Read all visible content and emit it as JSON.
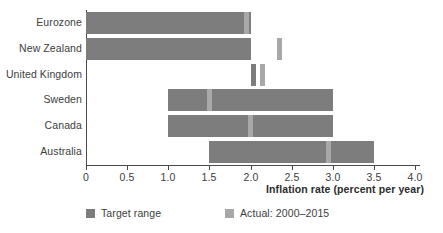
{
  "chart_data": {
    "type": "bar",
    "orientation": "horizontal",
    "title": "",
    "xlabel": "Inflation rate (percent per year)",
    "ylabel": "",
    "xlim": [
      0,
      4.0
    ],
    "xticks": [
      0,
      0.5,
      1.0,
      1.5,
      2.0,
      2.5,
      3.0,
      3.5,
      4.0
    ],
    "xtick_labels": [
      "0",
      "0.5",
      "1.0",
      "1.5",
      "2.0",
      "2.5",
      "3.0",
      "3.5",
      "4.0"
    ],
    "grid": false,
    "categories": [
      "Eurozone",
      "New Zealand",
      "United Kingdom",
      "Sweden",
      "Canada",
      "Australia"
    ],
    "legend": {
      "position": "bottom",
      "entries": [
        {
          "name": "Target range",
          "color": "#7d7d7d"
        },
        {
          "name": "Actual: 2000–2015",
          "color": "#a8a8a8"
        }
      ]
    },
    "series": [
      {
        "name": "Target range",
        "type": "range",
        "color": "#7d7d7d",
        "values": [
          {
            "category": "Eurozone",
            "low": 0.0,
            "high": 2.0
          },
          {
            "category": "New Zealand",
            "low": 0.0,
            "high": 2.0
          },
          {
            "category": "United Kingdom",
            "low": 2.0,
            "high": 2.05
          },
          {
            "category": "Sweden",
            "low": 1.0,
            "high": 3.0
          },
          {
            "category": "Canada",
            "low": 1.0,
            "high": 3.0
          },
          {
            "category": "Australia",
            "low": 1.5,
            "high": 3.5
          }
        ]
      },
      {
        "name": "Actual: 2000–2015",
        "type": "marker",
        "color": "#a8a8a8",
        "values": [
          {
            "category": "Eurozone",
            "value": 1.95
          },
          {
            "category": "New Zealand",
            "value": 2.35
          },
          {
            "category": "United Kingdom",
            "value": 2.15
          },
          {
            "category": "Sweden",
            "value": 1.5
          },
          {
            "category": "Canada",
            "value": 2.0
          },
          {
            "category": "Australia",
            "value": 2.95
          }
        ]
      }
    ]
  },
  "axis_title": "Inflation rate (percent per year)",
  "categories": [
    {
      "label": "Eurozone"
    },
    {
      "label": "New Zealand"
    },
    {
      "label": "United Kingdom"
    },
    {
      "label": "Sweden"
    },
    {
      "label": "Canada"
    },
    {
      "label": "Australia"
    }
  ],
  "ticks": [
    {
      "label": "0"
    },
    {
      "label": "0.5"
    },
    {
      "label": "1.0"
    },
    {
      "label": "1.5"
    },
    {
      "label": "2.0"
    },
    {
      "label": "2.5"
    },
    {
      "label": "3.0"
    },
    {
      "label": "3.5"
    },
    {
      "label": "4.0"
    }
  ],
  "legend": [
    {
      "label": "Target range"
    },
    {
      "label": "Actual: 2000–2015"
    }
  ],
  "colors": {
    "target": "#7d7d7d",
    "actual": "#a8a8a8",
    "axis": "#4a4a4a",
    "text": "#3d3d3d",
    "background": "#ffffff"
  }
}
